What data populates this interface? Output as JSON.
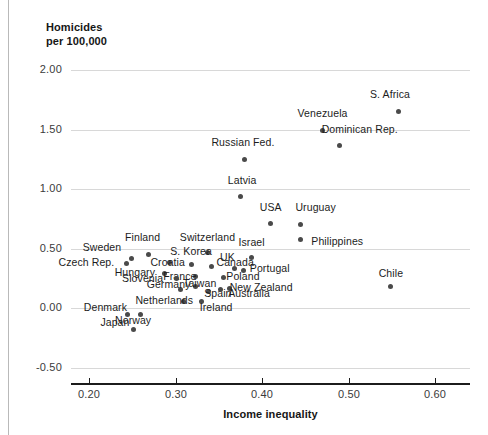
{
  "chart_data": {
    "type": "scatter",
    "title": "Homicides\nper 100,000",
    "xlabel": "Income inequality",
    "ylabel": "Homicides per 100,000",
    "xlim": [
      0.165,
      0.625
    ],
    "ylim": [
      -0.62,
      2.12
    ],
    "xticks": [
      "0.20",
      "0.30",
      "0.40",
      "0.50",
      "0.60"
    ],
    "xtick_values": [
      0.2,
      0.3,
      0.4,
      0.5,
      0.6
    ],
    "yticks": [
      "2.00",
      "1.50",
      "1.00",
      "0.50",
      "0.00",
      "-0.50"
    ],
    "ytick_values": [
      2.0,
      1.5,
      1.0,
      0.5,
      0.0,
      -0.5
    ],
    "grid": "horizontal",
    "legend": "none",
    "marker_color": "#4a4a4a",
    "grid_color": "#d8d8d8",
    "axis_color": "#1c1c1c",
    "points": [
      {
        "name": "S. Africa",
        "x": 0.558,
        "y": 1.65,
        "lx": 0.548,
        "ly": 1.79,
        "anchor": "center"
      },
      {
        "name": "Venezuela",
        "x": 0.47,
        "y": 1.49,
        "lx": 0.47,
        "ly": 1.63,
        "anchor": "center"
      },
      {
        "name": "Dominican Rep.",
        "x": 0.49,
        "y": 1.37,
        "lx": 0.513,
        "ly": 1.5,
        "anchor": "center"
      },
      {
        "name": "Russian Fed.",
        "x": 0.38,
        "y": 1.25,
        "lx": 0.378,
        "ly": 1.39,
        "anchor": "center"
      },
      {
        "name": "Latvia",
        "x": 0.375,
        "y": 0.94,
        "lx": 0.377,
        "ly": 1.07,
        "anchor": "center"
      },
      {
        "name": "USA",
        "x": 0.41,
        "y": 0.71,
        "lx": 0.41,
        "ly": 0.84,
        "anchor": "center"
      },
      {
        "name": "Uruguay",
        "x": 0.445,
        "y": 0.7,
        "lx": 0.462,
        "ly": 0.84,
        "anchor": "center"
      },
      {
        "name": "Philippines",
        "x": 0.445,
        "y": 0.58,
        "lx": 0.487,
        "ly": 0.56,
        "anchor": "center"
      },
      {
        "name": "Switzerland",
        "x": 0.337,
        "y": 0.465,
        "lx": 0.337,
        "ly": 0.59,
        "anchor": "center"
      },
      {
        "name": "Israel",
        "x": 0.388,
        "y": 0.425,
        "lx": 0.388,
        "ly": 0.545,
        "anchor": "center"
      },
      {
        "name": "Finland",
        "x": 0.269,
        "y": 0.455,
        "lx": 0.262,
        "ly": 0.59,
        "anchor": "center"
      },
      {
        "name": "Sweden",
        "x": 0.249,
        "y": 0.42,
        "lx": 0.215,
        "ly": 0.51,
        "anchor": "center"
      },
      {
        "name": "S. Korea",
        "x": 0.293,
        "y": 0.385,
        "lx": 0.318,
        "ly": 0.47,
        "anchor": "center"
      },
      {
        "name": "Czech Rep.",
        "x": 0.243,
        "y": 0.375,
        "lx": 0.197,
        "ly": 0.385,
        "anchor": "center"
      },
      {
        "name": "Croatia",
        "x": 0.318,
        "y": 0.37,
        "lx": 0.291,
        "ly": 0.38,
        "anchor": "center"
      },
      {
        "name": "Canada",
        "x": 0.342,
        "y": 0.35,
        "lx": 0.369,
        "ly": 0.38,
        "anchor": "center"
      },
      {
        "name": "UK",
        "x": 0.368,
        "y": 0.335,
        "lx": 0.36,
        "ly": 0.425,
        "anchor": "center"
      },
      {
        "name": "Portugal",
        "x": 0.379,
        "y": 0.32,
        "lx": 0.409,
        "ly": 0.33,
        "anchor": "center"
      },
      {
        "name": "Hungary",
        "x": 0.287,
        "y": 0.29,
        "lx": 0.253,
        "ly": 0.3,
        "anchor": "center"
      },
      {
        "name": "France",
        "x": 0.323,
        "y": 0.27,
        "lx": 0.305,
        "ly": 0.265,
        "anchor": "center"
      },
      {
        "name": "Poland",
        "x": 0.355,
        "y": 0.26,
        "lx": 0.378,
        "ly": 0.265,
        "anchor": "center"
      },
      {
        "name": "Slovenia",
        "x": 0.301,
        "y": 0.25,
        "lx": 0.262,
        "ly": 0.245,
        "anchor": "center"
      },
      {
        "name": "Taiwan",
        "x": 0.323,
        "y": 0.185,
        "lx": 0.328,
        "ly": 0.205,
        "anchor": "center"
      },
      {
        "name": "Germany",
        "x": 0.306,
        "y": 0.16,
        "lx": 0.292,
        "ly": 0.195,
        "anchor": "center"
      },
      {
        "name": "New Zealand",
        "x": 0.362,
        "y": 0.17,
        "lx": 0.399,
        "ly": 0.175,
        "anchor": "center"
      },
      {
        "name": "Spain",
        "x": 0.338,
        "y": 0.14,
        "lx": 0.349,
        "ly": 0.12,
        "anchor": "center"
      },
      {
        "name": "Australia",
        "x": 0.352,
        "y": 0.155,
        "lx": 0.385,
        "ly": 0.12,
        "anchor": "center"
      },
      {
        "name": "Chile",
        "x": 0.548,
        "y": 0.18,
        "lx": 0.549,
        "ly": 0.29,
        "anchor": "center"
      },
      {
        "name": "Netherlands",
        "x": 0.309,
        "y": 0.06,
        "lx": 0.287,
        "ly": 0.06,
        "anchor": "center"
      },
      {
        "name": "Ireland",
        "x": 0.33,
        "y": 0.055,
        "lx": 0.347,
        "ly": 0.005,
        "anchor": "center"
      },
      {
        "name": "Denmark",
        "x": 0.245,
        "y": -0.055,
        "lx": 0.219,
        "ly": 0.005,
        "anchor": "center"
      },
      {
        "name": "Norway",
        "x": 0.26,
        "y": -0.055,
        "lx": 0.251,
        "ly": -0.105,
        "anchor": "center"
      },
      {
        "name": "Japan",
        "x": 0.252,
        "y": -0.18,
        "lx": 0.23,
        "ly": -0.125,
        "anchor": "center"
      }
    ]
  }
}
